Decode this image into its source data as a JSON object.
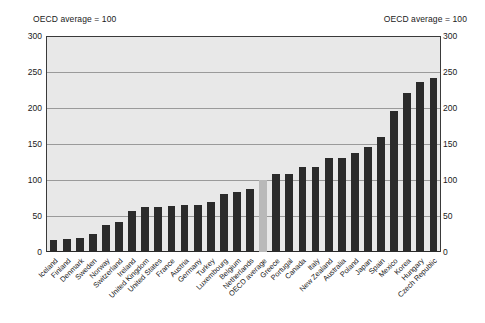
{
  "header": {
    "left_note": "OECD average = 100",
    "right_note": "OECD average = 100"
  },
  "axis": {
    "ticks": [
      "0",
      "50",
      "100",
      "150",
      "200",
      "250",
      "300"
    ]
  },
  "chart_data": {
    "type": "bar",
    "title": "",
    "subtitle": "",
    "xlabel": "",
    "ylabel": "OECD average = 100",
    "ylim": [
      0,
      300
    ],
    "yticks": [
      0,
      50,
      100,
      150,
      200,
      250,
      300
    ],
    "grid": true,
    "legend": "none",
    "highlight_category": "OECD average",
    "highlight_color": "#b9b9b9",
    "bar_color": "#2b2b2b",
    "plot_background": "#e8e8e8",
    "categories": [
      "Iceland",
      "Finland",
      "Denmark",
      "Sweden",
      "Norway",
      "Switzerland",
      "Ireland",
      "United Kingdom",
      "United States",
      "France",
      "Austria",
      "Germany",
      "Turkey",
      "Luxembourg",
      "Belgium",
      "Netherlands",
      "OECD average",
      "Greece",
      "Portugal",
      "Canada",
      "Italy",
      "New Zealand",
      "Australia",
      "Poland",
      "Japan",
      "Spain",
      "Mexico",
      "Korea",
      "Hungary",
      "Czech Republic"
    ],
    "values": [
      17,
      18,
      20,
      25,
      38,
      41,
      57,
      62,
      62,
      64,
      65,
      65,
      69,
      80,
      84,
      88,
      100,
      109,
      109,
      118,
      118,
      130,
      130,
      138,
      146,
      160,
      196,
      221,
      236,
      242
    ]
  }
}
